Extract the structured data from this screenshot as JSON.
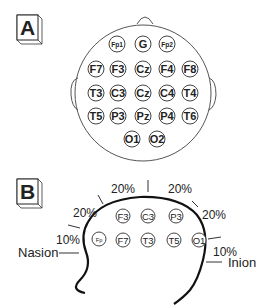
{
  "panel_a": {
    "label": "A",
    "electrodes": [
      {
        "name": "Fp1",
        "x": 117,
        "y": 44,
        "small": true
      },
      {
        "name": "G",
        "x": 143,
        "y": 44,
        "small": false
      },
      {
        "name": "Fp2",
        "x": 167,
        "y": 44,
        "small": true
      },
      {
        "name": "F7",
        "x": 96,
        "y": 69,
        "small": false
      },
      {
        "name": "F3",
        "x": 118,
        "y": 69,
        "small": false
      },
      {
        "name": "Cz",
        "x": 143,
        "y": 69,
        "small": false
      },
      {
        "name": "F4",
        "x": 167,
        "y": 69,
        "small": false
      },
      {
        "name": "F8",
        "x": 190,
        "y": 69,
        "small": false
      },
      {
        "name": "T3",
        "x": 96,
        "y": 93,
        "small": false
      },
      {
        "name": "C3",
        "x": 118,
        "y": 93,
        "small": false
      },
      {
        "name": "Cz",
        "x": 143,
        "y": 93,
        "small": false
      },
      {
        "name": "C4",
        "x": 167,
        "y": 93,
        "small": false
      },
      {
        "name": "T4",
        "x": 190,
        "y": 93,
        "small": false
      },
      {
        "name": "T5",
        "x": 96,
        "y": 116,
        "small": false
      },
      {
        "name": "P3",
        "x": 118,
        "y": 116,
        "small": false
      },
      {
        "name": "Pz",
        "x": 143,
        "y": 116,
        "small": false
      },
      {
        "name": "P4",
        "x": 167,
        "y": 116,
        "small": false
      },
      {
        "name": "T6",
        "x": 190,
        "y": 116,
        "small": false
      },
      {
        "name": "O1",
        "x": 132,
        "y": 139,
        "small": false
      },
      {
        "name": "O2",
        "x": 157,
        "y": 139,
        "small": false
      }
    ]
  },
  "panel_b": {
    "label": "B",
    "electrodes": [
      {
        "name": "Fp",
        "x": 99,
        "y": 239,
        "small": true
      },
      {
        "name": "F3",
        "x": 123,
        "y": 216,
        "small": false
      },
      {
        "name": "C3",
        "x": 148,
        "y": 216,
        "small": false
      },
      {
        "name": "P3",
        "x": 176,
        "y": 216,
        "small": false
      },
      {
        "name": "F7",
        "x": 123,
        "y": 240,
        "small": false
      },
      {
        "name": "T3",
        "x": 148,
        "y": 240,
        "small": false
      },
      {
        "name": "T5",
        "x": 174,
        "y": 240,
        "small": false
      },
      {
        "name": "O1",
        "x": 199,
        "y": 240,
        "small": false
      }
    ],
    "percent_labels": [
      {
        "text": "20%",
        "x": 123,
        "y": 193
      },
      {
        "text": "20%",
        "x": 180,
        "y": 193
      },
      {
        "text": "20%",
        "x": 85,
        "y": 217
      },
      {
        "text": "20%",
        "x": 214,
        "y": 219
      },
      {
        "text": "10%",
        "x": 68,
        "y": 244
      },
      {
        "text": "10%",
        "x": 225,
        "y": 256
      }
    ],
    "landmarks": {
      "nasion": "Nasion",
      "inion": "Inion"
    }
  }
}
